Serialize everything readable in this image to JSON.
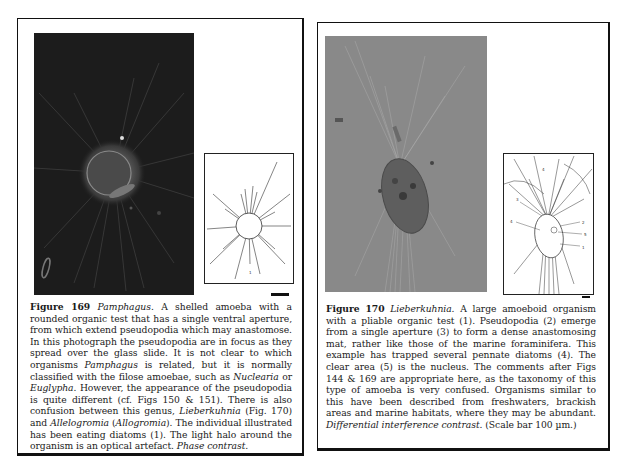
{
  "figures": [
    {
      "id": "169",
      "label": "Figure 169",
      "genus": "Pamphagus.",
      "caption_segments": [
        {
          "text": "A shelled amoeba with a rounded organic test that has a single ventral aperture, from which extend pseudopodia which may anastomose. In this photograph the pseudopodia are in focus as they spread over the glass slide. It is not clear to which organisms ",
          "italic": false
        },
        {
          "text": "Pamphagus",
          "italic": true
        },
        {
          "text": " is related, but it is normally classified with the filose amoebae, such as ",
          "italic": false
        },
        {
          "text": "Nuclearia",
          "italic": true
        },
        {
          "text": " or ",
          "italic": false
        },
        {
          "text": "Euglypha",
          "italic": true
        },
        {
          "text": ". However, the appearance of the pseudopodia is quite different (cf. Figs 150 & 151). There is also confusion between this genus, ",
          "italic": false
        },
        {
          "text": "Lieberkuhnia",
          "italic": true
        },
        {
          "text": " (Fig. 170) and ",
          "italic": false
        },
        {
          "text": "Allelogromia",
          "italic": true
        },
        {
          "text": " (",
          "italic": false
        },
        {
          "text": "Allogromia",
          "italic": true
        },
        {
          "text": "). The individual illustrated has been eating diatoms (1). The light halo around the organism is an optical artefact. ",
          "italic": false
        },
        {
          "text": "Phase contrast.",
          "italic": true
        }
      ],
      "photo": {
        "type": "phase-contrast-micrograph",
        "background": "#1b1b1b"
      },
      "drawing_labels": [
        "1"
      ]
    },
    {
      "id": "170",
      "label": "Figure 170",
      "genus": "Lieberkuhnia.",
      "caption_segments": [
        {
          "text": "A large amoeboid organism with a pliable organic test (1). Pseudopodia (2) emerge from a single aperture (3) to form a dense anastomosing mat, rather like those of the marine foraminifera. This example has trapped several pennate diatoms (4). The clear area (5) is the nucleus. The comments after Figs 144 & 169 are appropriate here, as the taxonomy of this type of amoeba is very confused. Organisms similar to this have been described from freshwaters, brackish areas and marine habitats, where they may be abundant. ",
          "italic": false
        },
        {
          "text": "Differential interference contrast.",
          "italic": true
        },
        {
          "text": " (Scale bar 100 µm.)",
          "italic": false
        }
      ],
      "photo": {
        "type": "differential-interference-contrast-micrograph",
        "background": "#8a8a8a"
      },
      "drawing_labels": [
        "1",
        "2",
        "3",
        "4",
        "4",
        "5"
      ]
    }
  ]
}
